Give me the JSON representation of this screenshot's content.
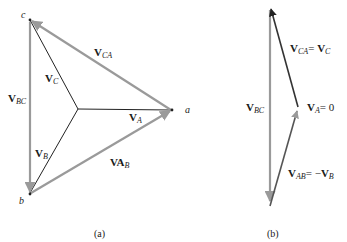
{
  "colors": {
    "line_vector": "#9a9a9a",
    "phase_vector": "#222222",
    "text": "#1a1a1a",
    "background": "#ffffff"
  },
  "diagram_a": {
    "caption": "(a)",
    "nodes": {
      "a": "a",
      "b": "b",
      "c": "c"
    },
    "labels": {
      "V_CA": {
        "main": "V",
        "sub": "CA"
      },
      "V_BC": {
        "main": "V",
        "sub": "BC"
      },
      "V_AB": {
        "main": "VA",
        "sub": "B"
      },
      "V_A": {
        "main": "V",
        "sub": "A"
      },
      "V_B": {
        "main": "V",
        "sub": "B"
      },
      "V_C": {
        "main": "V",
        "sub": "C"
      }
    }
  },
  "diagram_b": {
    "caption": "(b)",
    "labels": {
      "V_BC": {
        "main": "V",
        "sub": "BC"
      },
      "V_CA_eq": {
        "main": "V",
        "sub": "CA",
        "eq": "= ",
        "main2": "V",
        "sub2": "C"
      },
      "V_A_eq": {
        "main": "V",
        "sub": "A",
        "eq": "= 0"
      },
      "V_AB_eq": {
        "main": "V",
        "sub": "AB",
        "eq": "= −",
        "main2": "V",
        "sub2": "B"
      }
    }
  }
}
